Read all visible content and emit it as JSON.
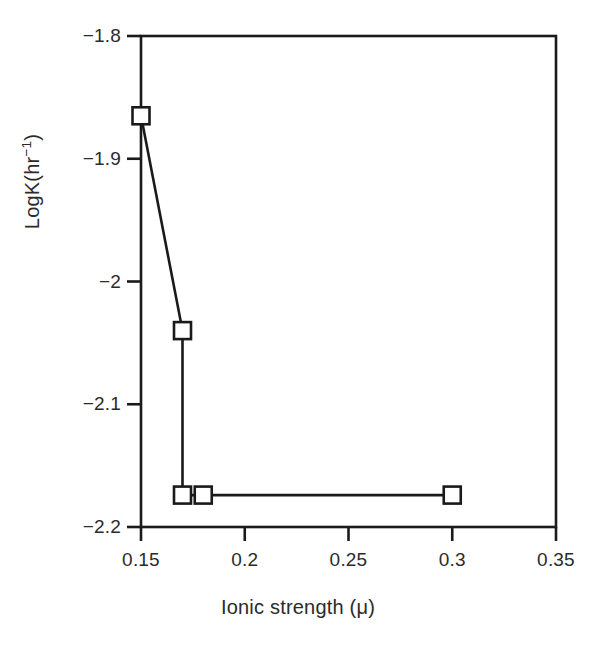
{
  "chart_data": {
    "type": "line",
    "title": "",
    "xlabel": "Ionic strength (μ)",
    "ylabel": "LogK(hr⁻¹)",
    "ylabel_base": "LogK(hr",
    "ylabel_sup": "-1",
    "ylabel_tail": ")",
    "xlim": [
      0.15,
      0.35
    ],
    "ylim": [
      -2.2,
      -1.8
    ],
    "grid": false,
    "legend": "none",
    "marker": "open-square",
    "line_color": "#1a1a1a",
    "marker_fill": "#ffffff",
    "marker_edge": "#1a1a1a",
    "axis_color": "#1a1a1a",
    "background": "#ffffff",
    "x": [
      0.15,
      0.17,
      0.17,
      0.18,
      0.3
    ],
    "y": [
      -1.865,
      -2.04,
      -2.174,
      -2.174,
      -2.174
    ],
    "points": [
      {
        "x": 0.15,
        "y": -1.865
      },
      {
        "x": 0.17,
        "y": -2.04
      },
      {
        "x": 0.17,
        "y": -2.174
      },
      {
        "x": 0.18,
        "y": -2.174
      },
      {
        "x": 0.3,
        "y": -2.174
      }
    ],
    "xticks": [
      0.15,
      0.2,
      0.25,
      0.3,
      0.35
    ],
    "xtick_labels": [
      "0.15",
      "0.2",
      "0.25",
      "0.3",
      "0.35"
    ],
    "yticks": [
      -1.8,
      -1.9,
      -2.0,
      -2.1,
      -2.2
    ],
    "ytick_labels": [
      "−1.8",
      "−1.9",
      "−2",
      "−2.1",
      "−2.2"
    ]
  }
}
